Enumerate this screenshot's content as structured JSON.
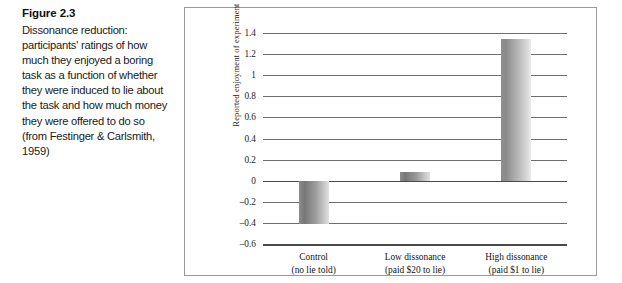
{
  "figure": {
    "number_label": "Figure 2.3",
    "caption": "Dissonance reduction: participants' ratings of how much they enjoyed a boring task as a function of whether they were induced to lie about the task and how much money they were offered to do so (from Festinger & Carlsmith, 1959)"
  },
  "chart_data": {
    "type": "bar",
    "title": "",
    "xlabel": "",
    "ylabel": "Reported enjoyment of experiment",
    "ylim": [
      -0.6,
      1.4
    ],
    "yticks": [
      1.4,
      1.2,
      1,
      0.8,
      0.6,
      0.4,
      0.2,
      0,
      -0.2,
      -0.4,
      -0.6
    ],
    "ytick_labels": [
      "1.4",
      "1.2",
      "1",
      "0.8",
      "0.6",
      "0.4",
      "0.2",
      "0",
      "–0.2",
      "–0.4",
      "–0.6"
    ],
    "grid": true,
    "legend": "none",
    "categories": [
      "Control",
      "Low dissonance",
      "High dissonance"
    ],
    "category_sublabels": [
      "(no lie told)",
      "(paid $20 to lie)",
      "(paid $1 to lie)"
    ],
    "values": [
      -0.41,
      0.08,
      1.34
    ],
    "bar_colors": [
      "#8d8d8d",
      "#8d8d8d",
      "#9b9b9b"
    ]
  },
  "axis_labels": {
    "y_title": "Reported enjoyment of experiment"
  },
  "colors": {
    "frame_border": "#9a9a9a",
    "gridline": "#6f6f6f",
    "axis_line": "#4a4a4a",
    "text": "#1b1b1b",
    "background": "#ffffff"
  }
}
